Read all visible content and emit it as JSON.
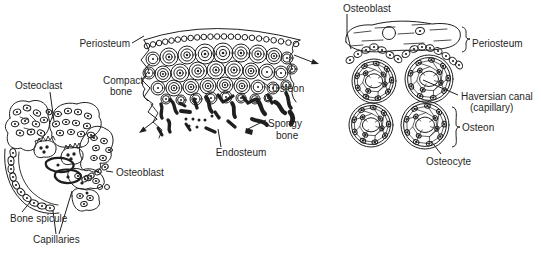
{
  "colors": {
    "ink": "#1f1f1f",
    "background": "#ffffff"
  },
  "figure": {
    "left": {
      "name": "bone spicule formation",
      "labels": {
        "osteoclast": "Osteoclast",
        "osteoblast": "Osteoblast",
        "bone_spicule": "Bone spicule",
        "capillaries": "Capillaries"
      }
    },
    "middle": {
      "name": "compact and spongy bone wedge",
      "labels": {
        "periosteum": "Periosteum",
        "compact_bone_line1": "Compact",
        "compact_bone_line2": "bone",
        "osteon": "Osteon",
        "spongy_bone_line1": "Spongy",
        "spongy_bone_line2": "bone",
        "endosteum": "Endosteum"
      }
    },
    "right": {
      "name": "osteon magnified detail",
      "labels": {
        "osteoblast": "Osteoblast",
        "periosteum": "Periosteum",
        "haversian_canal_line1": "Haversian canal",
        "haversian_canal_line2": "(capillary)",
        "osteon": "Osteon",
        "osteocyte": "Osteocyte"
      }
    }
  }
}
